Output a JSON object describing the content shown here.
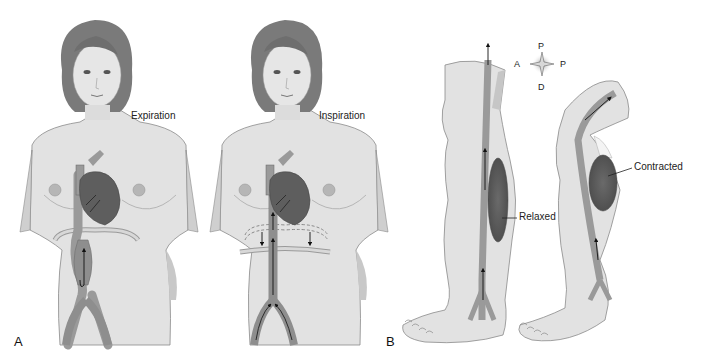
{
  "panel_a": {
    "letter": "A",
    "left_figure": {
      "label": "Expiration"
    },
    "right_figure": {
      "label": "Inspiration"
    }
  },
  "panel_b": {
    "letter": "B",
    "compass": {
      "top": "P",
      "left": "A",
      "right": "P",
      "bottom": "D"
    },
    "left_leg": {
      "label": "Relaxed"
    },
    "right_leg": {
      "label": "Contracted"
    }
  },
  "colors": {
    "skin": "#e2e2e2",
    "skin_shadow": "#c4c4c4",
    "outline": "#8a8a8a",
    "hair": "#7a7a7a",
    "vessel": "#9a9a9a",
    "vessel_dark": "#6e6e6e",
    "heart": "#5e5e5e",
    "muscle": "#5a5a5a",
    "text": "#222222"
  }
}
